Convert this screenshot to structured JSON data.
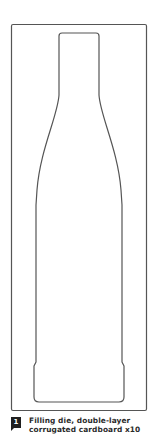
{
  "diagram": {
    "type": "die-cut template",
    "shape": "bottle outline",
    "stroke_color": "#555555",
    "background": "#ffffff"
  },
  "caption": {
    "badge_number": "1",
    "line1": "Filling die, double-layer",
    "line2": "corrugated cardboard x10"
  }
}
